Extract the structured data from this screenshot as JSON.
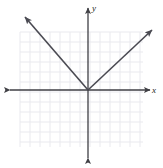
{
  "figure": {
    "type": "coordinate-plane-graph",
    "width": 163,
    "height": 168,
    "background_color": "#ffffff"
  },
  "axes": {
    "x_label": "x",
    "y_label": "y",
    "axis_color": "#3f3f44",
    "origin_pixel": {
      "x": 88,
      "y": 90
    },
    "x_axis_pixel": {
      "x1": 10,
      "x2": 150,
      "y": 90
    },
    "y_axis_pixel": {
      "x": 88,
      "y1": 8,
      "y2": 158
    },
    "arrowheads": [
      "left",
      "right",
      "up",
      "down"
    ]
  },
  "grid": {
    "color": "#e9e9ee",
    "cell_size_px": 10,
    "left_px": 20,
    "top_px": 32,
    "right_px": 143,
    "bottom_px": 147,
    "columns": 12,
    "rows": 11,
    "visible": true
  },
  "chart_data": {
    "type": "line",
    "title": "",
    "subtitle": "",
    "xlabel": "x",
    "ylabel": "y",
    "grid": true,
    "legend": null,
    "xlim": [
      -7,
      6
    ],
    "ylim": [
      -6,
      6
    ],
    "xticks": [
      -7,
      -6,
      -5,
      -4,
      -3,
      -2,
      -1,
      0,
      1,
      2,
      3,
      4,
      5,
      6
    ],
    "yticks": [
      -6,
      -5,
      -4,
      -3,
      -2,
      -1,
      0,
      1,
      2,
      3,
      4,
      5,
      6
    ],
    "xtick_labels": [],
    "ytick_labels": [],
    "annotations": [],
    "series": [
      {
        "name": "left-branch",
        "description": "ray from vertex at origin rising to the upper left",
        "x": [
          0,
          -6.3
        ],
        "y": [
          0,
          7.3
        ],
        "slope": -1.16,
        "arrow_end": "upper-left",
        "color": "#4a4a52"
      },
      {
        "name": "right-branch",
        "description": "ray from vertex at origin rising to the upper right",
        "x": [
          0,
          6.4
        ],
        "y": [
          0,
          6.0
        ],
        "slope": 0.94,
        "arrow_end": "upper-right",
        "color": "#4a4a52"
      }
    ],
    "vertex": {
      "x": 0,
      "y": 0
    }
  }
}
